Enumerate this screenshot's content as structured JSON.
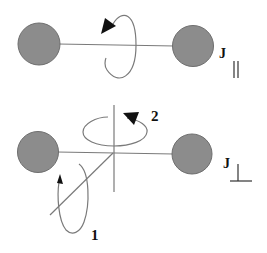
{
  "diagram": {
    "colors": {
      "atom_fill": "#8c8c8c",
      "atom_stroke": "#6e6e6e",
      "line": "#7a7a7a",
      "arrow": "#111111",
      "text": "#111111"
    },
    "top_panel": {
      "label_main": "J",
      "label_sub": "||",
      "description": "Rotation about the dimer axis"
    },
    "bottom_panel": {
      "label_main": "J",
      "label_sub": "⊥",
      "rotation_labels": [
        "1",
        "2"
      ],
      "description": "Rotations perpendicular to the dimer axis"
    }
  }
}
